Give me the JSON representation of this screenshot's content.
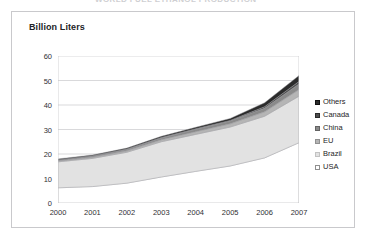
{
  "clipped_title": "WORLD FUEL ETHANOL PRODUCTION",
  "axis_title": "Billion Liters",
  "legend": {
    "items": [
      {
        "label": "Others",
        "color": "#2b2b2b",
        "border": "#111111"
      },
      {
        "label": "Canada",
        "color": "#4d4d4d",
        "border": "#2b2b2b"
      },
      {
        "label": "China",
        "color": "#8a8a8a",
        "border": "#636363"
      },
      {
        "label": "EU",
        "color": "#b5b5b5",
        "border": "#909090"
      },
      {
        "label": "Brazil",
        "color": "#e2e2e2",
        "border": "#c2c2c2"
      },
      {
        "label": "USA",
        "color": "#ffffff",
        "border": "#8f8f8f"
      }
    ]
  },
  "chart_data": {
    "type": "area",
    "stacked": true,
    "title": "WORLD FUEL ETHANOL PRODUCTION",
    "xlabel": "",
    "ylabel": "Billion Liters",
    "categories": [
      "2000",
      "2001",
      "2002",
      "2003",
      "2004",
      "2005",
      "2006",
      "2007"
    ],
    "x": [
      2000,
      2001,
      2002,
      2003,
      2004,
      2005,
      2006,
      2007
    ],
    "ylim": [
      0,
      60
    ],
    "yticks": [
      0,
      10,
      20,
      30,
      40,
      50,
      60
    ],
    "grid": "horizontal",
    "legend_position": "right",
    "series": [
      {
        "name": "USA",
        "color": "#ffffff",
        "values": [
          6.2,
          6.7,
          8.1,
          10.6,
          12.9,
          15.1,
          18.4,
          24.6
        ]
      },
      {
        "name": "Brazil",
        "color": "#e2e2e2",
        "values": [
          10.6,
          11.5,
          12.6,
          14.4,
          15.1,
          15.9,
          17.0,
          19.0
        ]
      },
      {
        "name": "EU",
        "color": "#b5b5b5",
        "values": [
          0.4,
          0.5,
          0.6,
          0.8,
          1.1,
          1.3,
          1.8,
          2.7
        ]
      },
      {
        "name": "China",
        "color": "#8a8a8a",
        "values": [
          0.3,
          0.4,
          0.5,
          0.7,
          1.0,
          1.2,
          1.5,
          2.3
        ]
      },
      {
        "name": "Canada",
        "color": "#4d4d4d",
        "values": [
          0.2,
          0.2,
          0.2,
          0.2,
          0.2,
          0.2,
          0.6,
          1.0
        ]
      },
      {
        "name": "Others",
        "color": "#2b2b2b",
        "values": [
          0.3,
          0.3,
          0.4,
          0.5,
          0.6,
          0.8,
          1.6,
          2.4
        ]
      }
    ],
    "totals": [
      18.0,
      19.6,
      22.4,
      27.2,
      30.9,
      34.5,
      40.9,
      52.0
    ]
  }
}
